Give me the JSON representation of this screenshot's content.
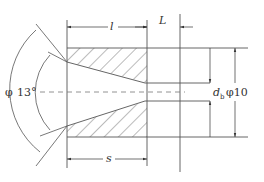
{
  "diagram": {
    "type": "nozzle cross-section",
    "labels": {
      "l": "l",
      "L": "L",
      "s": "s",
      "db_main": "d",
      "db_sub": "b",
      "phi_angle": "φ",
      "angle": "13°",
      "diameter": "φ10"
    },
    "colors": {
      "line": "#555555",
      "hatch": "#555555",
      "centerline": "#777777",
      "background": "#ffffff"
    }
  }
}
